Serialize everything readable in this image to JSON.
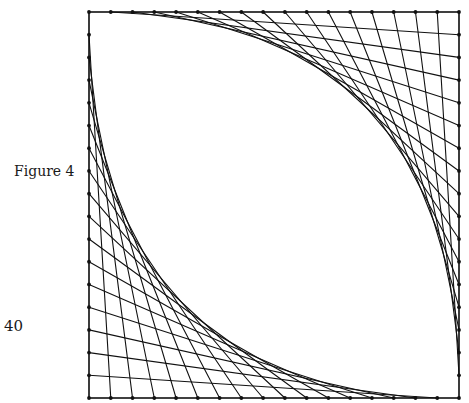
{
  "figure": {
    "label": "Figure 4",
    "page_number": "40",
    "square": {
      "x0": 89,
      "y0": 12,
      "x1": 459,
      "y1": 398
    },
    "points_per_side": 18,
    "intervals_per_side": 17,
    "families": [
      {
        "name": "upper-right",
        "from_edge": "top",
        "to_edge": "right",
        "rule": "top[k] -> right[k]"
      },
      {
        "name": "lower-left",
        "from_edge": "left",
        "to_edge": "bottom",
        "rule": "left[k] -> bottom[k]"
      }
    ],
    "stroke_color": "#111111",
    "dot_color": "#111111"
  }
}
